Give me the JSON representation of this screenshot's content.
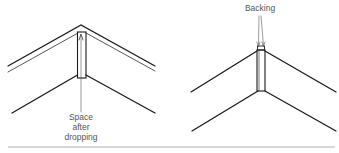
{
  "diagrams": [
    {
      "id": "left",
      "label_lines": [
        "Space",
        "after",
        "dropping"
      ]
    },
    {
      "id": "right",
      "label": "Backing"
    }
  ],
  "colors": {
    "line": "#1a1a1a",
    "label": "#555555",
    "rule": "#999999"
  }
}
